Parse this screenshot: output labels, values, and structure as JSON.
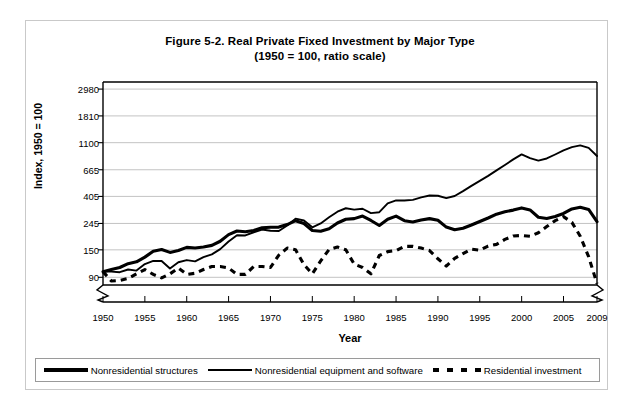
{
  "figure": {
    "title_line1": "Figure 5-2. Real Private Fixed Investment by Major Type",
    "title_line2": "(1950 = 100, ratio scale)"
  },
  "axes": {
    "ylabel": "Index, 1950 = 100",
    "xlabel": "Year"
  },
  "legend": {
    "items": [
      {
        "label": "Nonresidential structures",
        "style": "solid-thick"
      },
      {
        "label": "Nonresidential equipment and software",
        "style": "solid-medium"
      },
      {
        "label": "Residential investment",
        "style": "dashed"
      }
    ]
  },
  "chart_data": {
    "type": "line",
    "title": "Figure 5-2. Real Private Fixed Investment by Major Type (1950 = 100, ratio scale)",
    "xlabel": "Year",
    "ylabel": "Index, 1950 = 100",
    "yscale": "log",
    "ylim": [
      78,
      3400
    ],
    "xlim": [
      1950,
      2009
    ],
    "grid": true,
    "legend_position": "bottom",
    "yticks": [
      90,
      150,
      245,
      405,
      665,
      1100,
      1810,
      2980
    ],
    "ytick_labels": [
      "90",
      "150",
      "245",
      "405",
      "665",
      "1100",
      "1810",
      "2980"
    ],
    "xticks": [
      1950,
      1955,
      1960,
      1965,
      1970,
      1975,
      1980,
      1985,
      1990,
      1995,
      2000,
      2005,
      2009
    ],
    "xtick_labels": [
      "1950",
      "1955",
      "1960",
      "1965",
      "1970",
      "1975",
      "1980",
      "1985",
      "1990",
      "1995",
      "2000",
      "2005",
      "2009"
    ],
    "axis_break": "zigzag at both ends of x-axis",
    "x": [
      1950,
      1951,
      1952,
      1953,
      1954,
      1955,
      1956,
      1957,
      1958,
      1959,
      1960,
      1961,
      1962,
      1963,
      1964,
      1965,
      1966,
      1967,
      1968,
      1969,
      1970,
      1971,
      1972,
      1973,
      1974,
      1975,
      1976,
      1977,
      1978,
      1979,
      1980,
      1981,
      1982,
      1983,
      1984,
      1985,
      1986,
      1987,
      1988,
      1989,
      1990,
      1991,
      1992,
      1993,
      1994,
      1995,
      1996,
      1997,
      1998,
      1999,
      2000,
      2001,
      2002,
      2003,
      2004,
      2005,
      2006,
      2007,
      2008,
      2009
    ],
    "series": [
      {
        "name": "Nonresidential structures",
        "style": "solid-thick",
        "values": [
          100,
          104,
          108,
          116,
          120,
          131,
          146,
          151,
          143,
          148,
          157,
          155,
          158,
          163,
          176,
          199,
          213,
          210,
          215,
          226,
          228,
          229,
          240,
          258,
          245,
          215,
          212,
          222,
          247,
          265,
          268,
          281,
          259,
          236,
          265,
          281,
          258,
          252,
          261,
          268,
          260,
          229,
          218,
          224,
          238,
          254,
          271,
          291,
          304,
          314,
          327,
          315,
          275,
          269,
          279,
          295,
          321,
          331,
          318,
          253
        ]
      },
      {
        "name": "Nonresidential equipment and software",
        "style": "solid-medium",
        "values": [
          100,
          100,
          99,
          104,
          102,
          115,
          122,
          122,
          106,
          119,
          124,
          121,
          131,
          138,
          152,
          175,
          197,
          196,
          208,
          219,
          214,
          213,
          236,
          268,
          259,
          228,
          245,
          275,
          305,
          325,
          317,
          322,
          297,
          302,
          356,
          376,
          375,
          380,
          398,
          412,
          410,
          392,
          408,
          447,
          493,
          541,
          593,
          657,
          727,
          806,
          884,
          825,
          789,
          820,
          883,
          954,
          1013,
          1046,
          999,
          858
        ]
      },
      {
        "name": "Residential investment",
        "style": "dashed",
        "values": [
          100,
          84,
          85,
          88,
          96,
          104,
          95,
          89,
          96,
          107,
          95,
          97,
          104,
          110,
          110,
          107,
          95,
          95,
          110,
          110,
          108,
          136,
          155,
          150,
          114,
          96,
          122,
          151,
          158,
          150,
          115,
          108,
          96,
          135,
          145,
          148,
          160,
          160,
          155,
          148,
          127,
          111,
          128,
          140,
          152,
          149,
          161,
          166,
          182,
          194,
          196,
          193,
          206,
          231,
          258,
          278,
          250,
          193,
          132,
          80
        ]
      }
    ]
  }
}
